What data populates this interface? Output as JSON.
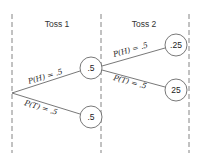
{
  "diagram": {
    "type": "probability-tree",
    "headers": {
      "toss1": "Toss 1",
      "toss2": "Toss 2"
    },
    "branches": {
      "toss1_heads": "P(H) = .5",
      "toss1_tails": "P(T) = .5",
      "toss2_heads": "P(H) = .5",
      "toss2_tails": "P(T) = .5"
    },
    "nodes": {
      "toss1_heads": ".5",
      "toss1_tails": ".5",
      "toss2_hh": ".25",
      "toss2_ht": "25"
    },
    "colors": {
      "line": "#555555",
      "text": "#222222",
      "background": "#ffffff"
    }
  }
}
